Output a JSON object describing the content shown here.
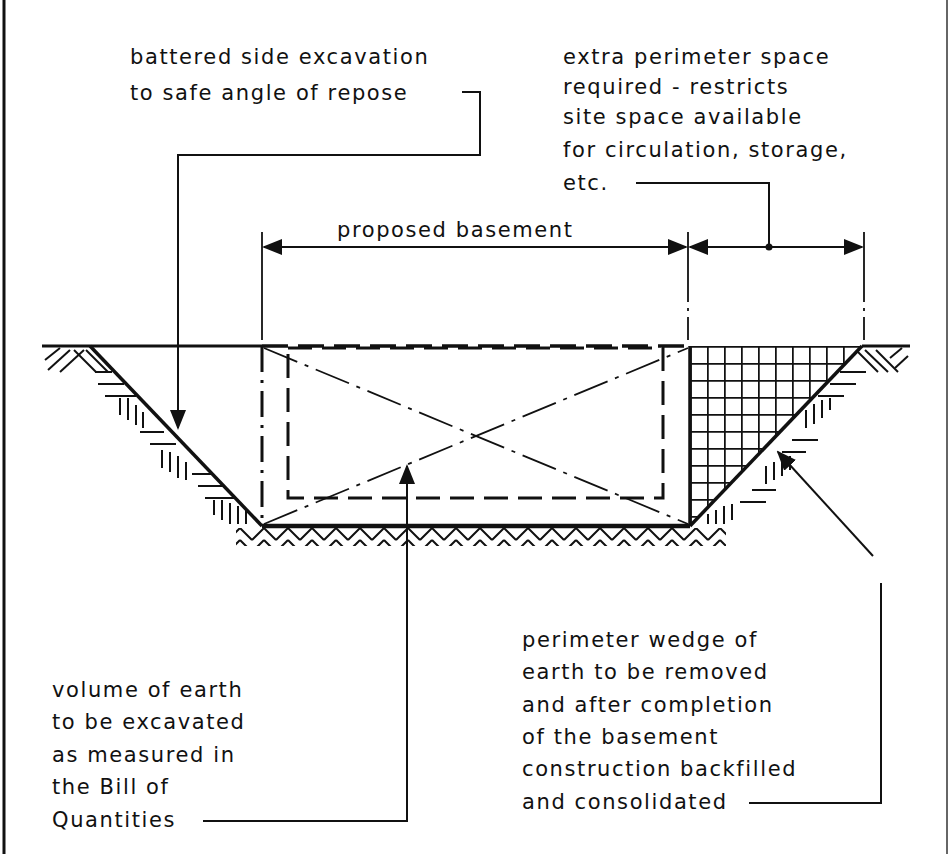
{
  "diagram": {
    "colors": {
      "ink": "#111111",
      "background": "#ffffff"
    },
    "dimensions": {
      "basement_label": "proposed basement"
    },
    "annotations": {
      "battered_side": {
        "lines": [
          "battered side excavation",
          "to safe angle of repose"
        ]
      },
      "extra_space": {
        "lines": [
          "extra perimeter space",
          "required - restricts",
          "site space available",
          "for circulation, storage,",
          "etc."
        ]
      },
      "volume": {
        "lines": [
          "volume of earth",
          "to be excavated",
          "as measured in",
          "the Bill of",
          "Quantities"
        ]
      },
      "wedge": {
        "lines": [
          "perimeter wedge of",
          "earth to be removed",
          "and after completion",
          "of the basement",
          "construction backfilled",
          "and consolidated"
        ]
      }
    },
    "elements": [
      "ground-surface-line",
      "battered-slope-left",
      "battered-slope-right",
      "excavation-base",
      "proposed-basement-outline",
      "basement-diagonals",
      "backfill-wedge-crosshatch",
      "earth-hatching"
    ]
  }
}
